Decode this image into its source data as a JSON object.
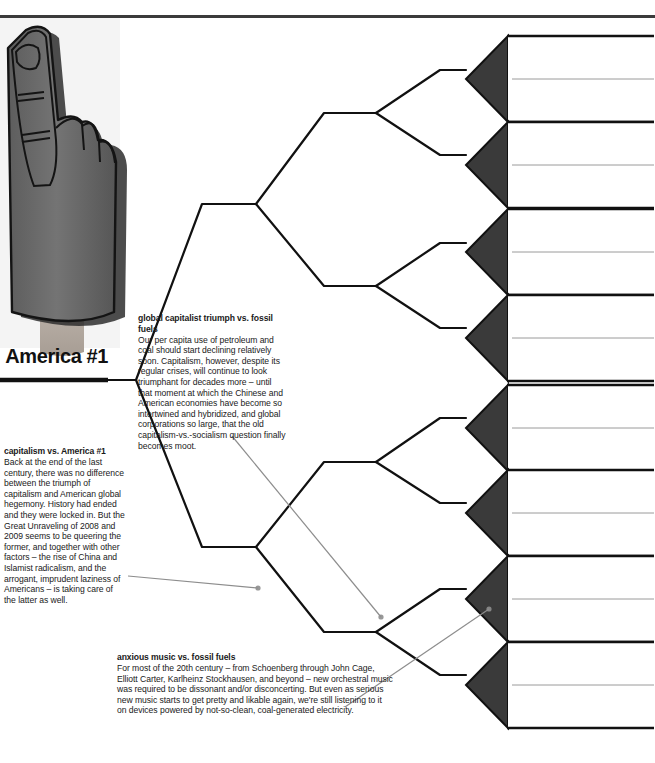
{
  "page": {
    "top_rule": true,
    "root_label": "America #1"
  },
  "photo": {
    "name": "foam-finger-photo",
    "alt": "number one foam finger",
    "colors": {
      "foam": "#6f6f6f",
      "foam_dark": "#4a4a4a",
      "outline": "#111111",
      "wrist": "#b9b0a8"
    }
  },
  "colors": {
    "line": "#111111",
    "leaf_arrow": "#3a3a3a",
    "leaf_border": "#111111",
    "divider": "#9a9a9a",
    "annotation": "#8d8d8d",
    "text": "#111111"
  },
  "tree": {
    "level1": [
      {
        "label": "medical mystery",
        "x": 230,
        "y": 204
      },
      {
        "label": "America #1",
        "x": 230,
        "y": 547
      }
    ],
    "level2": [
      {
        "label": "radio",
        "x": 350,
        "y": 113
      },
      {
        "label": "medical mystery",
        "x": 350,
        "y": 286
      },
      {
        "label": "America #1",
        "x": 350,
        "y": 462
      },
      {
        "label": "capitalism",
        "x": 350,
        "y": 632
      }
    ],
    "level3": [
      {
        "label": "feminism",
        "x": 466,
        "y": 70
      },
      {
        "label": "radio",
        "x": 466,
        "y": 155
      },
      {
        "label": "medical mystery",
        "x": 466,
        "y": 243
      },
      {
        "label": "network greatness",
        "x": 466,
        "y": 328
      },
      {
        "label": "America #1",
        "x": 466,
        "y": 418
      },
      {
        "label": "pubic hair",
        "x": 466,
        "y": 503
      },
      {
        "label": "fossil fuels",
        "x": 466,
        "y": 589
      },
      {
        "label": "capitalism",
        "x": 466,
        "y": 675
      }
    ]
  },
  "leaf_groups": [
    {
      "top": 36,
      "rows": [
        "serious new art = abstract art",
        "the feminist struggle"
      ]
    },
    {
      "top": 122,
      "rows": [
        "broadcast commercial radio",
        "Freudianism and psychoanalysis"
      ]
    },
    {
      "top": 209,
      "rows": [
        "medical mystery\n(e.g., fetal gender, DNA flaws)",
        "photographic film"
      ]
    },
    {
      "top": 295,
      "rows": [
        "network TV greatness",
        "evolution as a settled fact"
      ]
    },
    {
      "top": 385,
      "rows": [
        "global American hegemony",
        "letters"
      ]
    },
    {
      "top": 470,
      "rows": [
        "objectivity",
        "pubic hair"
      ]
    },
    {
      "top": 556,
      "rows": [
        "fossil fuels",
        "serious new orchestral music =\nanxious music"
      ]
    },
    {
      "top": 642,
      "rows": [
        "the inevitable triumph of capitalism",
        "printed books"
      ]
    }
  ],
  "captions": [
    {
      "id": "capitalism-vs-america",
      "title": "capitalism vs. America #1",
      "body": "Back at the end of the last century, there was no difference between the triumph of capitalism and American global hegemony. History had ended and they were locked in. But the Great Unraveling of 2008 and 2009 seems to be queering the former, and together with other factors – the rise of China and Islamist radicalism, and the arrogant, imprudent laziness of Americans – is taking care of the latter as well."
    },
    {
      "id": "global-capitalist-triumph",
      "title": "global capitalist triumph vs. fossil fuels",
      "body": "Our per capita use of petroleum and coal should start declining relatively soon. Capitalism, however, despite its regular crises, will continue to look triumphant for decades more – until that moment at which the Chinese and American economies have become so intertwined and hybridized, and global corporations so large, that the old capitalism-vs.-socialism question finally becomes moot."
    },
    {
      "id": "anxious-music-vs-fossil-fuels",
      "title": "anxious music vs. fossil fuels",
      "body": "For most of the 20th century – from Schoenberg through John Cage, Elliott Carter, Karlheinz Stockhausen, and beyond – new orchestral music was required to be dissonant and/or disconcerting. But even as serious new music starts to get pretty and likable again, we're still listening to it on devices powered by not-so-clean, coal-generated electricity."
    }
  ],
  "annotations": [
    {
      "name": "leader-capitalism-america",
      "x1": 128,
      "y1": 576,
      "x2": 258,
      "y2": 588
    },
    {
      "name": "leader-global-capitalist",
      "x1": 232,
      "y1": 436,
      "x2": 381,
      "y2": 617
    },
    {
      "name": "leader-anxious-music",
      "x1": 345,
      "y1": 707,
      "x2": 489,
      "y2": 609
    }
  ]
}
